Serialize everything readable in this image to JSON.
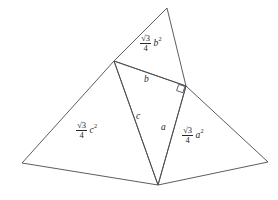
{
  "figure": {
    "canvas": {
      "width": 278,
      "height": 200,
      "background": "#ffffff"
    },
    "stroke_color": "#4a4a50",
    "text_color": "#26262b",
    "vertices": {
      "right_angle": {
        "x": 186,
        "y": 86,
        "name": "B"
      },
      "top_left": {
        "x": 114,
        "y": 61,
        "name": "C"
      },
      "bottom": {
        "x": 158,
        "y": 185,
        "name": "A"
      },
      "top_apex": {
        "x": 167,
        "y": 8,
        "name": "top-apex"
      },
      "left_outer": {
        "x": 22,
        "y": 163,
        "name": "left-outer"
      },
      "right_outer": {
        "x": 268,
        "y": 162,
        "name": "right-outer"
      }
    },
    "shapes": [
      {
        "name": "central-right-triangle",
        "points": "114,61 186,86 158,185"
      },
      {
        "name": "upper-equilateral-triangle",
        "points": "114,61 167,8 186,86"
      },
      {
        "name": "left-equilateral-triangle",
        "points": "114,61 22,163 158,185"
      },
      {
        "name": "right-equilateral-triangle",
        "points": "186,86 268,162 158,185"
      }
    ],
    "right_angle_marker": {
      "x": 186,
      "y": 86,
      "size": 7
    }
  },
  "labels": {
    "side_b": {
      "text": "b",
      "x": 147,
      "y": 80
    },
    "side_c": {
      "text": "c",
      "x": 139,
      "y": 117
    },
    "side_a": {
      "text": "a",
      "x": 164,
      "y": 128
    },
    "area_b": {
      "numerator": "√3",
      "denominator": "4",
      "term": "b",
      "exponent": "2",
      "x": 140,
      "y": 40
    },
    "area_c": {
      "numerator": "√3",
      "denominator": "4",
      "term": "c",
      "exponent": "2",
      "x": 76,
      "y": 127
    },
    "area_a": {
      "numerator": "√3",
      "denominator": "4",
      "term": "a",
      "exponent": "2",
      "x": 182,
      "y": 132
    }
  }
}
